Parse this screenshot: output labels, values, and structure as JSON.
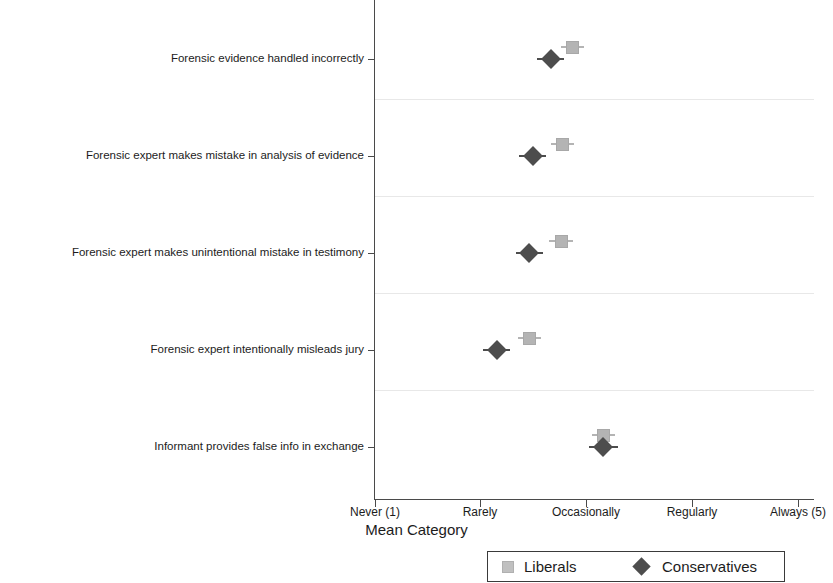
{
  "chart_data": {
    "type": "scatter",
    "title": "",
    "xlabel": "Mean Category",
    "ylabel": "",
    "orientation": "horizontal",
    "xlim": [
      1,
      5
    ],
    "grid": true,
    "grid_orientation": "horizontal",
    "legend_position": "bottom",
    "xticks": [
      {
        "value": 1,
        "label": "Never (1)"
      },
      {
        "value": 2,
        "label": "Rarely"
      },
      {
        "value": 3,
        "label": "Occasionally"
      },
      {
        "value": 4,
        "label": "Regularly"
      },
      {
        "value": 5,
        "label": "Always (5)"
      }
    ],
    "categories": [
      "Forensic evidence handled incorrectly",
      "Forensic expert makes mistake in analysis of evidence",
      "Forensic expert makes unintentional mistake in testimony",
      "Forensic expert intentionally misleads jury",
      "Informant provides false info in exchange"
    ],
    "series": [
      {
        "name": "Liberals",
        "marker": "square",
        "color": "#b4b4b4",
        "values": [
          2.87,
          2.77,
          2.76,
          2.46,
          3.16
        ],
        "ci_low": [
          2.76,
          2.66,
          2.65,
          2.35,
          3.05
        ],
        "ci_high": [
          2.98,
          2.88,
          2.87,
          2.57,
          3.27
        ]
      },
      {
        "name": "Conservatives",
        "marker": "diamond",
        "color": "#4d4d4d",
        "values": [
          2.66,
          2.49,
          2.46,
          2.15,
          3.16
        ],
        "ci_low": [
          2.53,
          2.36,
          2.33,
          2.02,
          3.02
        ],
        "ci_high": [
          2.79,
          2.62,
          2.59,
          2.28,
          3.3
        ]
      }
    ]
  },
  "legend": {
    "items": [
      {
        "label": "Liberals",
        "marker": "square"
      },
      {
        "label": "Conservatives",
        "marker": "diamond"
      }
    ]
  }
}
